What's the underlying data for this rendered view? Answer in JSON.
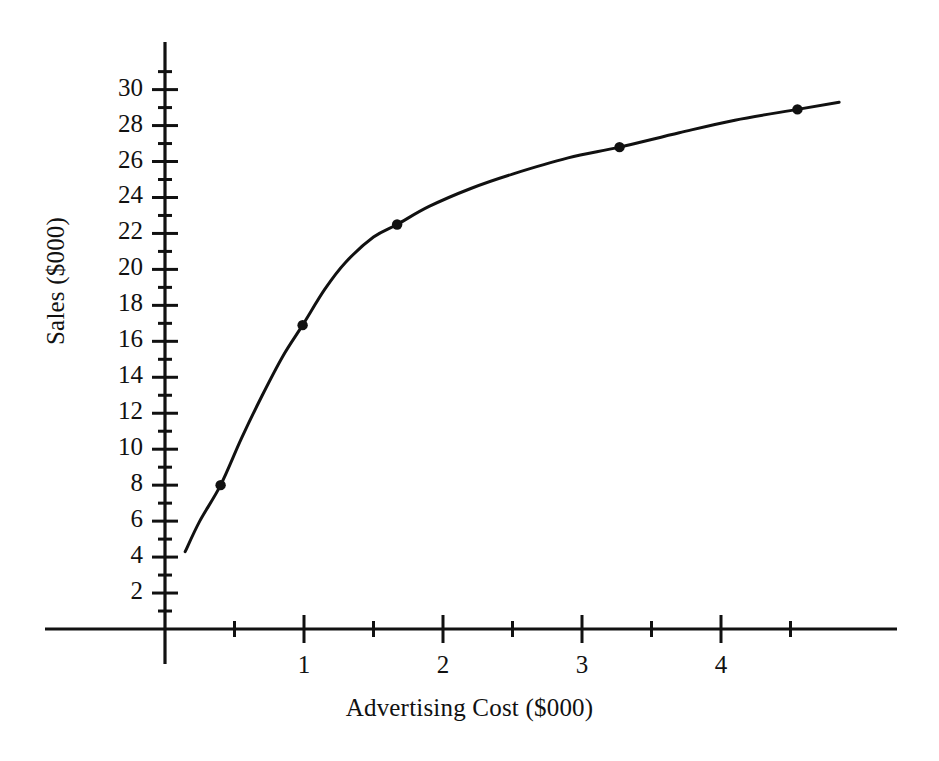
{
  "chart_data": {
    "type": "line",
    "title": "",
    "xlabel": "Advertising Cost ($000)",
    "ylabel": "Sales ($000)",
    "xlim": [
      0,
      5.25
    ],
    "ylim": [
      0,
      31
    ],
    "grid": false,
    "legend": null,
    "x_major_ticks": [
      1,
      2,
      3,
      4
    ],
    "x_minor_ticks": [
      0.5,
      1.5,
      2.5,
      3.5,
      4.5
    ],
    "x_tick_labels": [
      "1",
      "2",
      "3",
      "4"
    ],
    "y_major_ticks": [
      2,
      4,
      6,
      8,
      10,
      12,
      14,
      16,
      18,
      20,
      22,
      24,
      26,
      28,
      30
    ],
    "y_minor_ticks": [
      1,
      3,
      5,
      7,
      9,
      11,
      13,
      15,
      17,
      19,
      21,
      23,
      25,
      27,
      29,
      31
    ],
    "y_tick_labels": [
      "2",
      "4",
      "6",
      "8",
      "10",
      "12",
      "14",
      "16",
      "18",
      "20",
      "22",
      "24",
      "26",
      "28",
      "30"
    ],
    "markers": [
      {
        "x": 0.4,
        "y": 8.0
      },
      {
        "x": 0.99,
        "y": 16.9
      },
      {
        "x": 1.67,
        "y": 22.5
      },
      {
        "x": 3.27,
        "y": 26.8
      },
      {
        "x": 4.55,
        "y": 28.9
      }
    ],
    "curve": [
      {
        "x": 0.145,
        "y": 4.3
      },
      {
        "x": 0.25,
        "y": 6.0
      },
      {
        "x": 0.4,
        "y": 8.0
      },
      {
        "x": 0.55,
        "y": 10.6
      },
      {
        "x": 0.7,
        "y": 13.0
      },
      {
        "x": 0.85,
        "y": 15.2
      },
      {
        "x": 0.99,
        "y": 16.9
      },
      {
        "x": 1.15,
        "y": 18.9
      },
      {
        "x": 1.3,
        "y": 20.4
      },
      {
        "x": 1.5,
        "y": 21.8
      },
      {
        "x": 1.67,
        "y": 22.5
      },
      {
        "x": 1.9,
        "y": 23.5
      },
      {
        "x": 2.2,
        "y": 24.5
      },
      {
        "x": 2.5,
        "y": 25.3
      },
      {
        "x": 2.9,
        "y": 26.2
      },
      {
        "x": 3.27,
        "y": 26.8
      },
      {
        "x": 3.7,
        "y": 27.6
      },
      {
        "x": 4.1,
        "y": 28.3
      },
      {
        "x": 4.55,
        "y": 28.9
      },
      {
        "x": 4.85,
        "y": 29.3
      }
    ],
    "marker_color": "#111111",
    "line_color": "#111111",
    "axis_color": "#111111",
    "background_color": "#ffffff"
  }
}
